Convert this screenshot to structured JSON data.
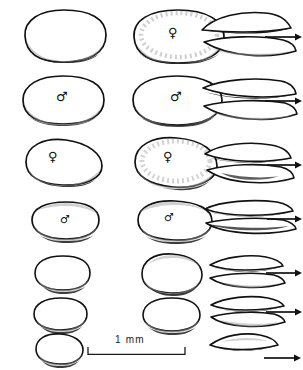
{
  "figure": {
    "background_color": "#ffffff",
    "ink_color": "#111111",
    "shading_color": "#8d8d8d",
    "columns": [
      {
        "id": "left",
        "label": "dorsal-view"
      },
      {
        "id": "middle",
        "label": "ventral-view"
      },
      {
        "id": "right",
        "label": "lateral-view"
      }
    ],
    "rows": [
      {
        "index": 1,
        "left": {
          "shape": "broad-oval",
          "symbol": "",
          "width": 90,
          "height": 54
        },
        "middle": {
          "shape": "broad-oval",
          "symbol": "♀",
          "width": 98,
          "height": 58
        },
        "right": {
          "views": 2,
          "arrow": "→",
          "shape": "lens"
        }
      },
      {
        "index": 2,
        "left": {
          "shape": "broad-oval",
          "symbol": "♂",
          "width": 88,
          "height": 50
        },
        "middle": {
          "shape": "broad-oval",
          "symbol": "♂",
          "width": 96,
          "height": 54
        },
        "right": {
          "views": 2,
          "arrow": "→",
          "shape": "lens"
        }
      },
      {
        "index": 3,
        "left": {
          "shape": "rounded-ovate",
          "symbol": "♀",
          "width": 80,
          "height": 48
        },
        "middle": {
          "shape": "rounded-ovate",
          "symbol": "♀",
          "width": 86,
          "height": 54
        },
        "right": {
          "views": 2,
          "arrow": "→",
          "shape": "lens"
        }
      },
      {
        "index": 4,
        "left": {
          "shape": "rounded-ovate",
          "symbol": "♂",
          "width": 70,
          "height": 40
        },
        "middle": {
          "shape": "rounded-ovate",
          "symbol": "♂",
          "width": 76,
          "height": 46
        },
        "right": {
          "views": 2,
          "arrow": "→",
          "shape": "lens"
        }
      },
      {
        "index": 5,
        "left": {
          "shape": "small-oval",
          "symbol": "",
          "width": 58,
          "height": 38
        },
        "middle": {
          "shape": "small-oval",
          "symbol": "",
          "width": 64,
          "height": 44
        },
        "right": {
          "views": 2,
          "arrow": "→",
          "shape": "lens"
        }
      },
      {
        "index": 6,
        "left": {
          "shape": "small-oval",
          "symbol": "",
          "width": 56,
          "height": 36
        },
        "middle": {
          "shape": "small-oval",
          "symbol": "",
          "width": 60,
          "height": 38
        },
        "right": {
          "views": 2,
          "arrow": "→",
          "shape": "lens"
        }
      },
      {
        "index": 7,
        "left": {
          "shape": "small-oval",
          "symbol": "",
          "width": 50,
          "height": 34
        },
        "middle": {
          "shape": "",
          "symbol": "",
          "width": 0,
          "height": 0
        },
        "right": {
          "views": 1,
          "arrow": "→",
          "shape": "lens"
        }
      }
    ]
  },
  "scale": {
    "label": "1 mm",
    "length_px": 97,
    "position": {
      "x": 88,
      "y": 345
    }
  },
  "symbols": {
    "female": "♀",
    "male": "♂",
    "arrow": "→"
  }
}
